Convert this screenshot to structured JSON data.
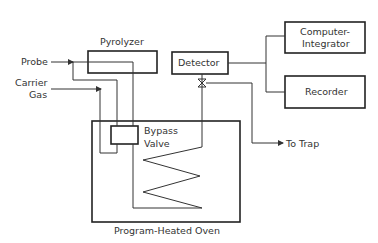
{
  "diagram": {
    "components": {
      "pyrolyzer": "Pyrolyzer",
      "detector": "Detector",
      "computer_integrator_line1": "Computer-",
      "computer_integrator_line2": "Integrator",
      "recorder": "Recorder",
      "bypass_valve_line1": "Bypass",
      "bypass_valve_line2": "Valve",
      "oven": "Program-Heated Oven"
    },
    "inputs": {
      "probe": "Probe",
      "carrier_gas_line1": "Carrier",
      "carrier_gas_line2": "Gas"
    },
    "outputs": {
      "to_trap": "To Trap"
    },
    "colors": {
      "line": "#333333",
      "background": "#ffffff"
    }
  }
}
